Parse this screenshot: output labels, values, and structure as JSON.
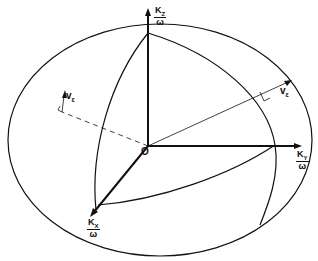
{
  "diagram": {
    "type": "wave-vector surface in k-space",
    "origin_label": "O",
    "axes": {
      "kz": {
        "num": "K",
        "sub": "Z",
        "den": "ω"
      },
      "ky": {
        "num": "K",
        "sub": "Y",
        "den": "ω"
      },
      "kx": {
        "num": "K",
        "sub": "X",
        "den": "ω"
      }
    },
    "ray_vectors": [
      {
        "label": "v",
        "sub": "ε",
        "position": "upper-right, perpendicular marker at surface"
      },
      {
        "label": "v",
        "sub": "ε",
        "position": "left, dashed (behind surface)"
      }
    ],
    "colors": {
      "stroke": "#111111",
      "background": "#ffffff"
    }
  }
}
